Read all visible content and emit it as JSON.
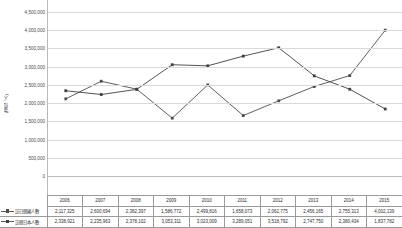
{
  "chart_data": {
    "type": "line",
    "title": "",
    "xlabel": "",
    "ylabel": "(單位：人)",
    "ylim": [
      0,
      4500000
    ],
    "ytick_step": 500000,
    "grid": true,
    "legend_position": "table-left",
    "categories": [
      "2006",
      "2007",
      "2008",
      "2009",
      "2010",
      "2011",
      "2012",
      "2013",
      "2014",
      "2015"
    ],
    "yticks": [
      "0",
      "500,000",
      "1,000,000",
      "1,500,000",
      "2,000,000",
      "2,500,000",
      "3,000,000",
      "3,500,000",
      "4,000,000",
      "4,500,000"
    ],
    "series": [
      {
        "name": "訪日韓國人數",
        "marker": "square",
        "color": "#4d4d4d",
        "values": [
          2117325,
          2600694,
          2382397,
          1586772,
          2499816,
          1658073,
          2062775,
          2456165,
          2755313,
          4002139
        ],
        "labels": [
          "2,117,325",
          "2,600,694",
          "2,382,397",
          "1,586,772",
          "2,499,816",
          "1,658,073",
          "2,062,775",
          "2,456,165",
          "2,755,313",
          "4,002,139"
        ]
      },
      {
        "name": "訪韓日本人數",
        "marker": "square",
        "color": "#3f3f3f",
        "values": [
          2338921,
          2235963,
          2378102,
          3053311,
          3023009,
          3289051,
          3518792,
          2747750,
          2380434,
          1837782
        ],
        "labels": [
          "2,338,921",
          "2,235,963",
          "2,378,102",
          "3,053,311",
          "3,023,009",
          "3,289,051",
          "3,518,792",
          "2,747,750",
          "2,380,434",
          "1,837,782"
        ]
      }
    ]
  }
}
